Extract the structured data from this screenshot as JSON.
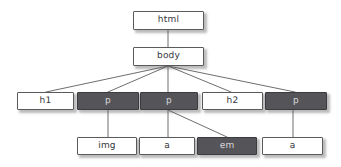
{
  "diagram": {
    "type": "tree",
    "background_color": "#ffffff",
    "node_fill_light": "#ffffff",
    "node_fill_dark": "#545459",
    "node_border_color": "#5a5a5a",
    "light_text_color": "#35353a",
    "dark_text_color": "#d8d8dc",
    "edge_color": "#6e6e73",
    "nodes": [
      {
        "id": "html",
        "label": "html",
        "style": "light",
        "x": 133,
        "y": 11,
        "w": 71,
        "h": 19
      },
      {
        "id": "body",
        "label": "body",
        "style": "light",
        "x": 133,
        "y": 47,
        "w": 71,
        "h": 19
      },
      {
        "id": "h1",
        "label": "h1",
        "style": "light",
        "x": 17,
        "y": 92,
        "w": 57,
        "h": 18
      },
      {
        "id": "p1",
        "label": "p",
        "style": "dark",
        "x": 77,
        "y": 92,
        "w": 62,
        "h": 18
      },
      {
        "id": "p2",
        "label": "p",
        "style": "dark",
        "x": 140,
        "y": 92,
        "w": 58,
        "h": 18
      },
      {
        "id": "h2",
        "label": "h2",
        "style": "light",
        "x": 202,
        "y": 92,
        "w": 61,
        "h": 18
      },
      {
        "id": "p3",
        "label": "p",
        "style": "dark",
        "x": 265,
        "y": 92,
        "w": 62,
        "h": 18
      },
      {
        "id": "img",
        "label": "img",
        "style": "light",
        "x": 77,
        "y": 137,
        "w": 60,
        "h": 18
      },
      {
        "id": "a1",
        "label": "a",
        "style": "light",
        "x": 139,
        "y": 137,
        "w": 56,
        "h": 18
      },
      {
        "id": "em",
        "label": "em",
        "style": "dark",
        "x": 197,
        "y": 137,
        "w": 60,
        "h": 18
      },
      {
        "id": "a2",
        "label": "a",
        "style": "light",
        "x": 262,
        "y": 137,
        "w": 61,
        "h": 18
      }
    ],
    "edges": [
      {
        "from": "html",
        "to": "body",
        "x1": 168,
        "y1": 30,
        "x2": 168,
        "y2": 47
      },
      {
        "from": "body",
        "to": "h1",
        "x1": 168,
        "y1": 66,
        "x2": 46,
        "y2": 92
      },
      {
        "from": "body",
        "to": "p1",
        "x1": 168,
        "y1": 66,
        "x2": 108,
        "y2": 92
      },
      {
        "from": "body",
        "to": "p2",
        "x1": 168,
        "y1": 66,
        "x2": 168,
        "y2": 92
      },
      {
        "from": "body",
        "to": "h2",
        "x1": 168,
        "y1": 66,
        "x2": 231,
        "y2": 92
      },
      {
        "from": "body",
        "to": "p3",
        "x1": 168,
        "y1": 66,
        "x2": 295,
        "y2": 92
      },
      {
        "from": "p1",
        "to": "img",
        "x1": 108,
        "y1": 110,
        "x2": 108,
        "y2": 137
      },
      {
        "from": "p2",
        "to": "a1",
        "x1": 168,
        "y1": 110,
        "x2": 168,
        "y2": 137
      },
      {
        "from": "p2",
        "to": "em",
        "x1": 168,
        "y1": 110,
        "x2": 227,
        "y2": 137
      },
      {
        "from": "p3",
        "to": "a2",
        "x1": 293,
        "y1": 110,
        "x2": 293,
        "y2": 137
      }
    ]
  }
}
